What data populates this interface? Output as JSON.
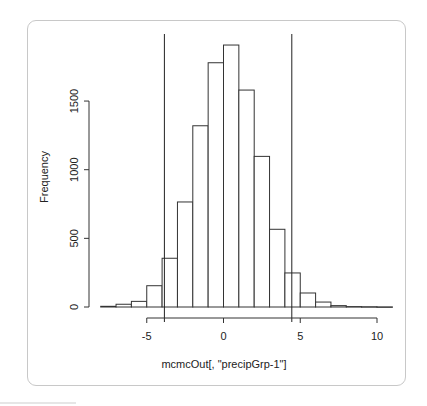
{
  "chart_data": {
    "type": "bar",
    "subtype": "histogram",
    "title": "",
    "xlabel": "mcmcOut[, \"precipGrp-1\"]",
    "ylabel": "Frequency",
    "bin_edges": [
      -8,
      -7,
      -6,
      -5,
      -4,
      -3,
      -2,
      -1,
      0,
      1,
      2,
      3,
      4,
      5,
      6,
      7,
      8,
      9,
      10,
      11
    ],
    "categories": [
      "-8 to -7",
      "-7 to -6",
      "-6 to -5",
      "-5 to -4",
      "-4 to -3",
      "-3 to -2",
      "-2 to -1",
      "-1 to 0",
      "0 to 1",
      "1 to 2",
      "2 to 3",
      "3 to 4",
      "4 to 5",
      "5 to 6",
      "6 to 7",
      "7 to 8",
      "8 to 9",
      "9 to 10",
      "10 to 11"
    ],
    "values": [
      5,
      20,
      41,
      155,
      355,
      765,
      1320,
      1779,
      1908,
      1580,
      1097,
      566,
      248,
      102,
      36,
      10,
      3,
      2,
      1
    ],
    "xticks": [
      -5,
      0,
      5,
      10
    ],
    "xtick_labels": [
      "-5",
      "0",
      "5",
      "10"
    ],
    "yticks": [
      0,
      500,
      1000,
      1500
    ],
    "ytick_labels": [
      "0",
      "500",
      "1000",
      "1500"
    ],
    "xlim": [
      -8,
      11
    ],
    "ylim": [
      0,
      1908
    ],
    "vertical_lines": [
      -3.85,
      4.45
    ],
    "grid": false,
    "legend": null
  },
  "colors": {
    "bar_fill": "#ffffff",
    "bar_stroke": "#333333",
    "frame_border": "#c8c8c8"
  }
}
